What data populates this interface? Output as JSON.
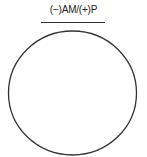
{
  "diagram": {
    "label": "(−)AM/(+)P",
    "shape": "circle",
    "stroke_color": "#333333",
    "fill_color": "#ffffff"
  }
}
